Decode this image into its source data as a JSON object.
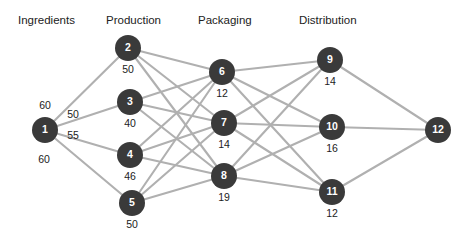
{
  "diagram": {
    "background_color": "#ffffff",
    "node_color": "#3a3a3a",
    "node_text_color": "#ffffff",
    "edge_color": "#b0b0b0",
    "label_color": "#222222"
  },
  "columns": [
    {
      "key": "ingredients",
      "label": "Ingredients",
      "x": 18,
      "y": 24
    },
    {
      "key": "production",
      "label": "Production",
      "x": 106,
      "y": 24
    },
    {
      "key": "packaging",
      "label": "Packaging",
      "x": 198,
      "y": 24
    },
    {
      "key": "distribution",
      "label": "Distribution",
      "x": 299,
      "y": 24
    }
  ],
  "nodes": [
    {
      "id": "1",
      "label": "1",
      "value": "",
      "cx": 45,
      "cy": 130,
      "r": 13,
      "column": "ingredients"
    },
    {
      "id": "2",
      "label": "2",
      "value": "50",
      "cx": 128,
      "cy": 48,
      "r": 13,
      "column": "production"
    },
    {
      "id": "3",
      "label": "3",
      "value": "40",
      "cx": 130,
      "cy": 102,
      "r": 13,
      "column": "production"
    },
    {
      "id": "4",
      "label": "4",
      "value": "46",
      "cx": 130,
      "cy": 155,
      "r": 13,
      "column": "production"
    },
    {
      "id": "5",
      "label": "5",
      "value": "50",
      "cx": 132,
      "cy": 203,
      "r": 13,
      "column": "production"
    },
    {
      "id": "6",
      "label": "6",
      "value": "12",
      "cx": 222,
      "cy": 72,
      "r": 13,
      "column": "packaging"
    },
    {
      "id": "7",
      "label": "7",
      "value": "14",
      "cx": 224,
      "cy": 123,
      "r": 13,
      "column": "packaging"
    },
    {
      "id": "8",
      "label": "8",
      "value": "19",
      "cx": 224,
      "cy": 176,
      "r": 13,
      "column": "packaging"
    },
    {
      "id": "9",
      "label": "9",
      "value": "14",
      "cx": 330,
      "cy": 60,
      "r": 13,
      "column": "distribution"
    },
    {
      "id": "10",
      "label": "10",
      "value": "16",
      "cx": 332,
      "cy": 127,
      "r": 13,
      "column": "distribution"
    },
    {
      "id": "11",
      "label": "11",
      "value": "12",
      "cx": 332,
      "cy": 192,
      "r": 13,
      "column": "distribution"
    },
    {
      "id": "12",
      "label": "12",
      "value": "",
      "cx": 438,
      "cy": 130,
      "r": 13,
      "column": "sink"
    }
  ],
  "edges": [
    {
      "from": "1",
      "to": "2"
    },
    {
      "from": "1",
      "to": "3"
    },
    {
      "from": "1",
      "to": "4"
    },
    {
      "from": "1",
      "to": "5"
    },
    {
      "from": "2",
      "to": "6"
    },
    {
      "from": "2",
      "to": "7"
    },
    {
      "from": "2",
      "to": "8"
    },
    {
      "from": "3",
      "to": "6"
    },
    {
      "from": "3",
      "to": "7"
    },
    {
      "from": "3",
      "to": "8"
    },
    {
      "from": "4",
      "to": "6"
    },
    {
      "from": "4",
      "to": "7"
    },
    {
      "from": "4",
      "to": "8"
    },
    {
      "from": "5",
      "to": "6"
    },
    {
      "from": "5",
      "to": "7"
    },
    {
      "from": "5",
      "to": "8"
    },
    {
      "from": "6",
      "to": "9"
    },
    {
      "from": "6",
      "to": "10"
    },
    {
      "from": "6",
      "to": "11"
    },
    {
      "from": "7",
      "to": "9"
    },
    {
      "from": "7",
      "to": "10"
    },
    {
      "from": "7",
      "to": "11"
    },
    {
      "from": "8",
      "to": "9"
    },
    {
      "from": "8",
      "to": "10"
    },
    {
      "from": "8",
      "to": "11"
    },
    {
      "from": "9",
      "to": "12"
    },
    {
      "from": "10",
      "to": "12"
    },
    {
      "from": "11",
      "to": "12"
    }
  ],
  "edge_labels": [
    {
      "id": "e1-2",
      "text": "60",
      "x": 45,
      "y": 109
    },
    {
      "id": "e1-3",
      "text": "50",
      "x": 73,
      "y": 118
    },
    {
      "id": "e1-4",
      "text": "55",
      "x": 73,
      "y": 139
    },
    {
      "id": "e1-5",
      "text": "60",
      "x": 44,
      "y": 163
    }
  ],
  "chart_data": {
    "type": "diagram",
    "subtype": "layered-network-flow",
    "title": "",
    "layers": [
      "Ingredients",
      "Production",
      "Packaging",
      "Distribution"
    ],
    "node_values": {
      "1": null,
      "2": 50,
      "3": 40,
      "4": 46,
      "5": 50,
      "6": 12,
      "7": 14,
      "8": 19,
      "9": 14,
      "10": 16,
      "11": 12,
      "12": null
    },
    "edge_values": {
      "1-2": 60,
      "1-3": 50,
      "1-4": 55,
      "1-5": 60
    },
    "edge_count": 28,
    "node_count": 12
  }
}
